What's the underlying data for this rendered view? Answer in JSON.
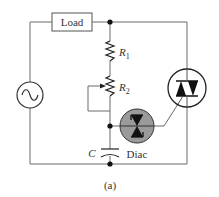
{
  "diagram": {
    "caption": "(a)",
    "components": {
      "load": {
        "label": "Load"
      },
      "r1": {
        "label": "R",
        "sub": "1"
      },
      "r2": {
        "label": "R",
        "sub": "2"
      },
      "capacitor": {
        "label": "C"
      },
      "diac": {
        "label": "Diac",
        "fill": "#9a9a9a"
      },
      "triac": {
        "label": ""
      },
      "source": {
        "type": "ac-source"
      }
    },
    "colors": {
      "wire": "#6b6b6b",
      "symbol": "#222222",
      "diac_fill": "#9a9a9a"
    }
  }
}
